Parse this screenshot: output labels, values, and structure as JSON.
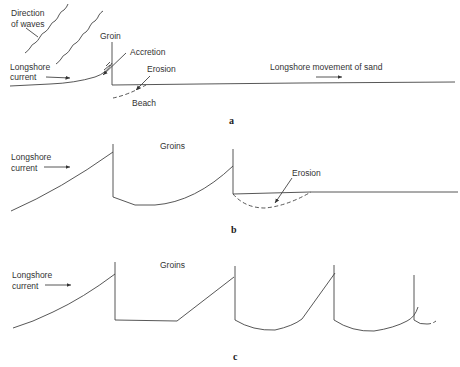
{
  "panels": {
    "a": {
      "label": "a",
      "direction_of_waves_line1": "Direction",
      "direction_of_waves_line2": "of waves",
      "groin": "Groin",
      "accretion": "Accretion",
      "erosion": "Erosion",
      "beach": "Beach",
      "longshore_current_line1": "Longshore",
      "longshore_current_line2": "current",
      "longshore_movement": "Longshore movement of sand"
    },
    "b": {
      "label": "b",
      "groins": "Groins",
      "erosion": "Erosion",
      "longshore_current_line1": "Longshore",
      "longshore_current_line2": "current"
    },
    "c": {
      "label": "c",
      "groins": "Groins",
      "longshore_current_line1": "Longshore",
      "longshore_current_line2": "current"
    }
  },
  "colors": {
    "line": "#444444",
    "text": "#333333",
    "background": "#ffffff"
  }
}
